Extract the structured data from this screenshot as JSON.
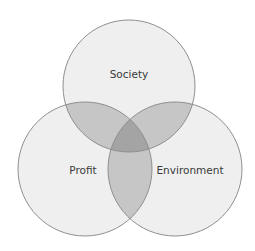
{
  "diagram": {
    "type": "venn",
    "sets": [
      {
        "label": "Society",
        "cx": 129,
        "cy": 86,
        "r": 66
      },
      {
        "label": "Profit",
        "cx": 85,
        "cy": 169,
        "r": 67
      },
      {
        "label": "Environment",
        "cx": 175,
        "cy": 169,
        "r": 67
      }
    ],
    "colors": {
      "fill": "#efefef",
      "pair_overlap": "#c6c6c6",
      "triple_overlap": "#a4a4a4",
      "stroke": "#8f8f8f"
    }
  }
}
